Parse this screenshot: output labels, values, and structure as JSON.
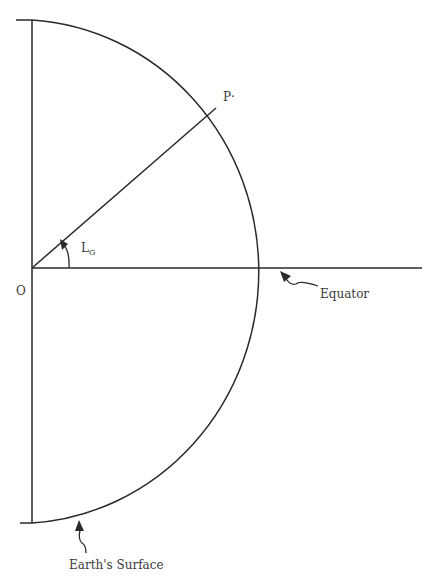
{
  "diagram": {
    "labels": {
      "origin": "O",
      "point": "P",
      "point_dot": "·",
      "angle_main": "L",
      "angle_sub": "G",
      "equator": "Equator",
      "surface": "Earth's Surface"
    },
    "colors": {
      "line": "#2a2a2a",
      "text": "#3a3a3a",
      "background": "#ffffff"
    }
  }
}
